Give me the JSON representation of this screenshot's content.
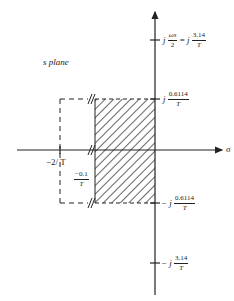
{
  "diagram": {
    "plane_label": "s plane",
    "real_axis_label": "σ",
    "imag_axis_ticks": [
      {
        "prefix": "j",
        "lhs_num": "ωs",
        "lhs_den": "2",
        "eq": "=",
        "mid": "j",
        "num": "3.14",
        "den": "T"
      },
      {
        "prefix": "j",
        "num": "0.6114",
        "den": "T"
      },
      {
        "prefix": "− j",
        "num": "0.6114",
        "den": "T"
      },
      {
        "prefix": "− j",
        "num": "3.14",
        "den": "T"
      }
    ],
    "real_axis_ticks": [
      {
        "label": "−2/ T"
      },
      {
        "num": "−0.1",
        "den": "T"
      }
    ],
    "colors": {
      "line": "#222222",
      "background": "#ffffff"
    }
  }
}
